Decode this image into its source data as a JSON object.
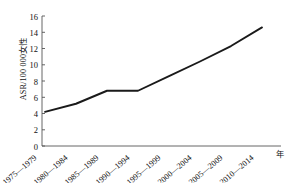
{
  "chart_data": {
    "type": "line",
    "title": "",
    "subtitle": "",
    "xlabel": "年",
    "ylabel": "ASR/100 000女性",
    "categories": [
      "1975—1979",
      "1980—1984",
      "1985—1989",
      "1990—1994",
      "1995—1999",
      "2000—2004",
      "2005—2009",
      "2010—2014"
    ],
    "values": [
      4.2,
      5.2,
      6.8,
      6.8,
      8.6,
      10.4,
      12.3,
      14.6
    ],
    "series": [
      {
        "name": "ASR",
        "values": [
          4.2,
          5.2,
          6.8,
          6.8,
          8.6,
          10.4,
          12.3,
          14.6
        ]
      }
    ],
    "ylim": [
      0,
      16
    ],
    "yticks": [
      0,
      2,
      4,
      6,
      8,
      10,
      12,
      14,
      16
    ],
    "ytick_labels": [
      "0",
      "2",
      "4",
      "6",
      "8",
      "10",
      "12",
      "14",
      "16"
    ],
    "grid": false,
    "legend": "none",
    "line_color": "#1a1a1a",
    "axis_color": "#555555",
    "background": "#ffffff"
  }
}
